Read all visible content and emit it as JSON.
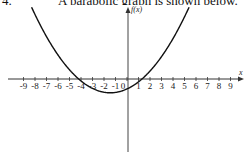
{
  "question": {
    "number": "4.",
    "text": "A parabolic graph is shown below."
  },
  "chart_data": {
    "type": "line",
    "title": "",
    "xlabel": "x",
    "ylabel": "f(x)",
    "xlim": [
      -9,
      9
    ],
    "x_ticks": [
      -9,
      -8,
      -7,
      -6,
      -5,
      -4,
      -3,
      -2,
      -1,
      0,
      1,
      2,
      3,
      4,
      5,
      6,
      7,
      8,
      9
    ],
    "x_tick_labels": [
      "-9",
      "-8",
      "-7",
      "-6",
      "-5",
      "-4",
      "-3",
      "-2",
      "-1",
      "0",
      "1",
      "2",
      "3",
      "4",
      "5",
      "6",
      "7",
      "8",
      "9"
    ],
    "grid": false,
    "legend": null,
    "series": [
      {
        "name": "parabola",
        "shape": "upward-opening parabola",
        "x_intercepts": [
          -4.2,
          1.3
        ],
        "vertex": {
          "x": -1.0,
          "y": -1.2
        },
        "points": [
          {
            "x": -8.1,
            "y": 6.2
          },
          {
            "x": -6,
            "y": 3.3
          },
          {
            "x": -4.2,
            "y": 0
          },
          {
            "x": -3,
            "y": -0.7
          },
          {
            "x": -1,
            "y": -1.2
          },
          {
            "x": 0,
            "y": -1.0
          },
          {
            "x": 1.3,
            "y": 0
          },
          {
            "x": 3,
            "y": 2.1
          },
          {
            "x": 5.5,
            "y": 6.2
          }
        ]
      }
    ]
  }
}
